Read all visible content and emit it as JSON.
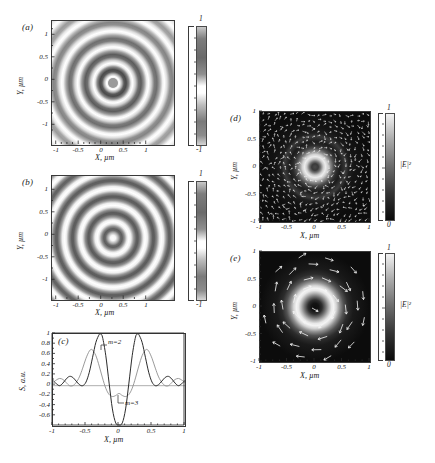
{
  "figure": {
    "background": "#ffffff",
    "panels": [
      "(a)",
      "(b)",
      "(c)",
      "(d)",
      "(e)"
    ]
  },
  "axis_titles": {
    "x_um": "X, µm",
    "y_um": "Y, µm",
    "s_au": "S, a.u."
  },
  "panel_a": {
    "label": "(a)",
    "xlabel": "X, µm",
    "ylabel": "Y, µm",
    "xticks": [
      "-1",
      "-0.5",
      "0",
      "0.5",
      "1"
    ],
    "xtickvals": [
      -1,
      -0.5,
      0,
      0.5,
      1
    ],
    "yticks": [
      "1",
      "0.5",
      "0",
      "-0.5",
      "-1"
    ],
    "ytickvals": [
      1,
      0.5,
      0,
      -0.5,
      -1
    ],
    "xlim": [
      -1.3,
      1.3
    ],
    "ylim": [
      -1.3,
      1.3
    ],
    "colorbar": {
      "top": "1",
      "bottom": "-1",
      "vmin": -1,
      "vmax": 1
    }
  },
  "panel_b": {
    "label": "(b)",
    "xlabel": "X, µm",
    "ylabel": "Y, µm",
    "xticks": [
      "-1",
      "-0.5",
      "0",
      "0.5",
      "1"
    ],
    "xtickvals": [
      -1,
      -0.5,
      0,
      0.5,
      1
    ],
    "yticks": [
      "1",
      "0.5",
      "0",
      "-0.5",
      "-1"
    ],
    "ytickvals": [
      1,
      0.5,
      0,
      -0.5,
      -1
    ],
    "xlim": [
      -1.3,
      1.3
    ],
    "ylim": [
      -1.3,
      1.3
    ],
    "colorbar": {
      "top": "1",
      "bottom": "-1",
      "vmin": -1,
      "vmax": 1
    }
  },
  "panel_c": {
    "label": "(c)",
    "series_label_m2": "m=2",
    "series_label_m3": "m=3"
  },
  "panel_d": {
    "label": "(d)",
    "xlabel": "X, µm",
    "ylabel": "Y, µm",
    "xticks": [
      "-1",
      "-0.5",
      "0",
      "0.5",
      "1"
    ],
    "xtickvals": [
      -1,
      -0.5,
      0,
      0.5,
      1
    ],
    "yticks": [
      "1",
      "0.5",
      "0",
      "-0.5",
      "-1"
    ],
    "ytickvals": [
      1,
      0.5,
      0,
      -0.5,
      -1
    ],
    "xlim": [
      -1.15,
      1.15
    ],
    "ylim": [
      -1.15,
      1.15
    ],
    "colorbar": {
      "top": "1",
      "bottom": "0",
      "title": "|E|²",
      "vmin": 0,
      "vmax": 1
    }
  },
  "panel_e": {
    "label": "(e)",
    "xlabel": "X, µm",
    "ylabel": "Y, µm",
    "xticks": [
      "-1",
      "-0.5",
      "0",
      "0.5",
      "1"
    ],
    "xtickvals": [
      -1,
      -0.5,
      0,
      0.5,
      1
    ],
    "yticks": [
      "1",
      "0.5",
      "0",
      "-0.5",
      "-1"
    ],
    "ytickvals": [
      1,
      0.5,
      0,
      -0.5,
      -1
    ],
    "xlim": [
      -1.15,
      1.15
    ],
    "ylim": [
      -1.15,
      1.15
    ],
    "colorbar": {
      "top": "1",
      "bottom": "0",
      "title": "|E|²",
      "vmin": 0,
      "vmax": 1
    }
  },
  "chart_data": [
    {
      "id": "panel-a",
      "type": "heatmap",
      "title": "(a)",
      "xlabel": "X, µm",
      "ylabel": "Y, µm",
      "xlim": [
        -1.3,
        1.3
      ],
      "ylim": [
        -1.3,
        1.3
      ],
      "zlim": [
        -1,
        1
      ],
      "colormap": "gray-oscillatory",
      "grid": false,
      "description": "Concentric oscillatory ring interference pattern, low contrast with diffuse outer rings and a small gray core",
      "radial_profile": {
        "r": [
          0.0,
          0.08,
          0.16,
          0.24,
          0.33,
          0.42,
          0.52,
          0.62,
          0.72,
          0.83,
          0.93,
          1.04,
          1.15,
          1.26
        ],
        "value": [
          -0.25,
          0.62,
          -0.7,
          0.78,
          -0.62,
          0.52,
          -0.42,
          0.34,
          -0.26,
          0.2,
          -0.15,
          0.11,
          -0.07,
          0.05
        ]
      },
      "ring_count": 7
    },
    {
      "id": "panel-b",
      "type": "heatmap",
      "title": "(b)",
      "xlabel": "X, µm",
      "ylabel": "Y, µm",
      "xlim": [
        -1.3,
        1.3
      ],
      "ylim": [
        -1.3,
        1.3
      ],
      "zlim": [
        -1,
        1
      ],
      "colormap": "gray-oscillatory",
      "grid": false,
      "description": "High-contrast concentric ring interference pattern with a bright white core",
      "radial_profile": {
        "r": [
          0.0,
          0.09,
          0.18,
          0.27,
          0.36,
          0.46,
          0.56,
          0.66,
          0.77,
          0.88,
          0.99,
          1.1,
          1.21
        ],
        "value": [
          1.0,
          -0.85,
          0.9,
          -0.88,
          0.86,
          -0.84,
          0.82,
          -0.8,
          0.78,
          -0.76,
          0.74,
          -0.72,
          0.7
        ]
      },
      "ring_count": 8
    },
    {
      "id": "panel-c",
      "type": "line",
      "title": "(c)",
      "xlabel": "X, µm",
      "ylabel": "S, a.u.",
      "xlim": [
        -1,
        1
      ],
      "ylim": [
        -0.78,
        1.0
      ],
      "xticks": [
        -1,
        -0.5,
        0,
        0.5,
        1
      ],
      "xticklabels": [
        "-1",
        "-0.5",
        "0",
        "0.5",
        "1"
      ],
      "yticks": [
        1,
        0.8,
        0.6,
        0.4,
        0.2,
        0,
        -0.2,
        -0.4,
        -0.6
      ],
      "yticklabels": [
        "1",
        "0.8",
        "0.6",
        "0.4",
        "0.2",
        "0",
        "-0.2",
        "-0.4",
        "-0.6"
      ],
      "grid": false,
      "legend_position": "inline-annotation",
      "series": [
        {
          "name": "m=2",
          "color": "#2b2b2b",
          "x": [
            -1.0,
            -0.95,
            -0.9,
            -0.85,
            -0.8,
            -0.75,
            -0.7,
            -0.65,
            -0.6,
            -0.55,
            -0.5,
            -0.45,
            -0.4,
            -0.35,
            -0.3,
            -0.28,
            -0.25,
            -0.2,
            -0.15,
            -0.1,
            -0.05,
            0.0,
            0.05,
            0.1,
            0.15,
            0.2,
            0.25,
            0.28,
            0.3,
            0.35,
            0.4,
            0.45,
            0.5,
            0.55,
            0.6,
            0.65,
            0.7,
            0.75,
            0.8,
            0.85,
            0.9,
            0.95,
            1.0
          ],
          "y": [
            0.1,
            0.04,
            0.0,
            0.05,
            0.13,
            0.18,
            0.16,
            0.09,
            0.02,
            0.0,
            0.07,
            0.26,
            0.55,
            0.84,
            0.99,
            1.0,
            0.94,
            0.58,
            0.05,
            -0.45,
            -0.72,
            -0.76,
            -0.72,
            -0.45,
            0.05,
            0.58,
            0.94,
            1.0,
            0.99,
            0.84,
            0.55,
            0.26,
            0.07,
            0.0,
            0.02,
            0.09,
            0.16,
            0.18,
            0.13,
            0.05,
            0.0,
            0.04,
            0.1
          ]
        },
        {
          "name": "m=3",
          "color": "#8e8e8e",
          "x": [
            -1.0,
            -0.95,
            -0.9,
            -0.85,
            -0.8,
            -0.75,
            -0.7,
            -0.65,
            -0.6,
            -0.55,
            -0.5,
            -0.45,
            -0.42,
            -0.4,
            -0.35,
            -0.3,
            -0.25,
            -0.2,
            -0.15,
            -0.1,
            -0.05,
            0.0,
            0.05,
            0.1,
            0.15,
            0.2,
            0.25,
            0.3,
            0.35,
            0.4,
            0.42,
            0.45,
            0.5,
            0.55,
            0.6,
            0.65,
            0.7,
            0.75,
            0.8,
            0.85,
            0.9,
            0.95,
            1.0
          ],
          "y": [
            0.06,
            0.11,
            0.14,
            0.12,
            0.06,
            0.0,
            0.0,
            0.06,
            0.17,
            0.34,
            0.53,
            0.67,
            0.7,
            0.69,
            0.58,
            0.38,
            0.15,
            -0.05,
            -0.17,
            -0.21,
            -0.19,
            -0.15,
            -0.19,
            -0.21,
            -0.17,
            -0.05,
            0.15,
            0.38,
            0.58,
            0.69,
            0.7,
            0.67,
            0.53,
            0.34,
            0.17,
            0.06,
            0.0,
            0.0,
            0.06,
            0.12,
            0.14,
            0.11,
            0.06
          ]
        }
      ]
    },
    {
      "id": "panel-d",
      "type": "heatmap",
      "title": "(d)",
      "xlabel": "X, µm",
      "ylabel": "Y, µm",
      "xlim": [
        -1.15,
        1.15
      ],
      "ylim": [
        -1.15,
        1.15
      ],
      "zlim": [
        0,
        1
      ],
      "colorbar_title": "|E|²",
      "colormap": "gray-dark-background",
      "grid": false,
      "description": "Dark background intensity map with a bright annulus (donut) centred at origin, darker core, plus a dense white vector field of small arrows",
      "radial_profile": {
        "r": [
          0.0,
          0.05,
          0.1,
          0.15,
          0.2,
          0.25,
          0.3,
          0.38,
          0.45,
          0.55,
          0.65,
          0.75,
          0.85,
          1.0,
          1.15
        ],
        "value": [
          0.3,
          0.42,
          0.68,
          0.88,
          0.95,
          0.88,
          0.7,
          0.42,
          0.22,
          0.12,
          0.18,
          0.12,
          0.06,
          0.03,
          0.02
        ]
      },
      "vector_field": {
        "style": "dense-small-arrows",
        "color": "#ffffff",
        "count_approx": 400,
        "pattern": "azimuthal-with-radial-scatter"
      }
    },
    {
      "id": "panel-e",
      "type": "heatmap",
      "title": "(e)",
      "xlabel": "X, µm",
      "ylabel": "Y, µm",
      "xlim": [
        -1.15,
        1.15
      ],
      "ylim": [
        -1.15,
        1.15
      ],
      "zlim": [
        0,
        1
      ],
      "colorbar_title": "|E|²",
      "colormap": "gray-dark-background",
      "grid": false,
      "description": "Dark background intensity map with a broad bright ring and a dark vortex core, overlaid with sparse large white arrows in a circulating pattern",
      "radial_profile": {
        "r": [
          0.0,
          0.08,
          0.15,
          0.22,
          0.3,
          0.38,
          0.45,
          0.52,
          0.62,
          0.72,
          0.85,
          1.0,
          1.15
        ],
        "value": [
          0.02,
          0.08,
          0.25,
          0.55,
          0.85,
          0.97,
          0.92,
          0.72,
          0.4,
          0.2,
          0.09,
          0.04,
          0.02
        ]
      },
      "vector_field": {
        "style": "sparse-large-arrows",
        "color": "#ffffff",
        "count_approx": 40,
        "pattern": "circulating-vortex"
      }
    }
  ]
}
